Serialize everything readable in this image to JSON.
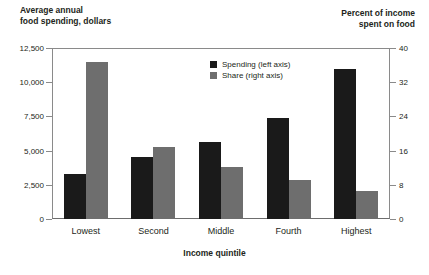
{
  "chart_data": {
    "type": "bar",
    "title": "",
    "categories": [
      "Lowest",
      "Second",
      "Middle",
      "Fourth",
      "Highest"
    ],
    "series": [
      {
        "name": "Spending (left axis)",
        "axis": "left",
        "color": "#1a1a1a",
        "values": [
          3300,
          4500,
          5600,
          7350,
          11000
        ]
      },
      {
        "name": "Share (right axis)",
        "axis": "right",
        "color": "#6e6e6e",
        "values": [
          36.7,
          16.8,
          12.2,
          9.1,
          6.5
        ]
      }
    ],
    "xlabel": "Income quintile",
    "ylabel": "Average annual\nfood spending, dollars",
    "y2label": "Percent of income\nspent on food",
    "ylim": [
      0,
      12500
    ],
    "y2lim": [
      0,
      40
    ],
    "yticks": [
      "0",
      "2,500",
      "5,000",
      "7,500",
      "10,000",
      "12,500"
    ],
    "ytick_values": [
      0,
      2500,
      5000,
      7500,
      10000,
      12500
    ],
    "y2ticks": [
      "0",
      "8",
      "16",
      "24",
      "32",
      "40"
    ],
    "y2tick_values": [
      0,
      8,
      16,
      24,
      32,
      40
    ],
    "grid": false,
    "legend_position": "upper center"
  },
  "legend": {
    "items": [
      {
        "label": "Spending (left axis)",
        "color": "#1a1a1a"
      },
      {
        "label": "Share (right axis)",
        "color": "#6e6e6e"
      }
    ]
  }
}
